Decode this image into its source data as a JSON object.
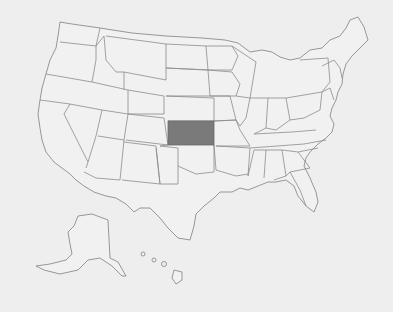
{
  "map": {
    "type": "choropleth",
    "region": "United States",
    "highlighted_states": [
      "Kansas"
    ],
    "colors": {
      "background": "#eeeeee",
      "state_fill": "#f1f1f1",
      "border": "#8c8c8c",
      "highlight": "#7a7a7a"
    },
    "insets": [
      "Alaska",
      "Hawaii"
    ],
    "highlight_label": "Kansas"
  }
}
